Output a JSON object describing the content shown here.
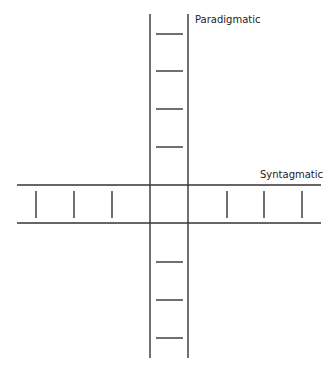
{
  "diagram": {
    "labels": {
      "vertical_axis": "Paradigmatic",
      "horizontal_axis": "Syntagmatic"
    },
    "line_color": "#333333",
    "vertical_band": {
      "x_left": 150,
      "x_right": 188,
      "y_top": 14,
      "y_bottom": 358
    },
    "horizontal_band": {
      "y_top": 185,
      "y_bottom": 223,
      "x_left": 17,
      "x_right": 321
    },
    "vertical_ticks_y": [
      34,
      71,
      109,
      147,
      262,
      300,
      338
    ],
    "horizontal_ticks_x": [
      36,
      74,
      112,
      227,
      264,
      302
    ]
  }
}
